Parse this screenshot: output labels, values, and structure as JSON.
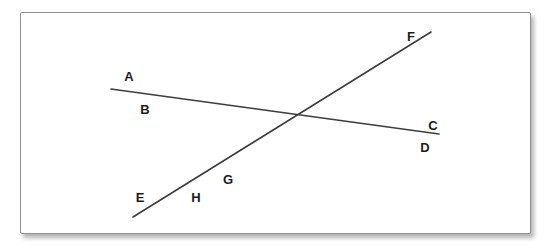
{
  "diagram": {
    "colors": {
      "line": "#3d3d3d",
      "label": "#1c1c1c",
      "panel_border": "#8f8f8f",
      "panel_background": "#ffffff",
      "page_background": "#ffffff",
      "shadow": "#b4b4b4"
    },
    "lines": [
      {
        "name": "line-through-AB-CD",
        "x1": 111,
        "y1": 89,
        "x2": 439,
        "y2": 134,
        "stroke_width": 1.6
      },
      {
        "name": "line-through-EH-GF",
        "x1": 133,
        "y1": 217,
        "x2": 431,
        "y2": 32,
        "stroke_width": 1.6
      }
    ],
    "labels": [
      {
        "text": "A",
        "x": 129,
        "y": 76
      },
      {
        "text": "B",
        "x": 145,
        "y": 109
      },
      {
        "text": "C",
        "x": 433,
        "y": 125
      },
      {
        "text": "D",
        "x": 425,
        "y": 147
      },
      {
        "text": "E",
        "x": 140,
        "y": 197
      },
      {
        "text": "F",
        "x": 411,
        "y": 36
      },
      {
        "text": "G",
        "x": 228,
        "y": 179
      },
      {
        "text": "H",
        "x": 196,
        "y": 197
      }
    ]
  }
}
